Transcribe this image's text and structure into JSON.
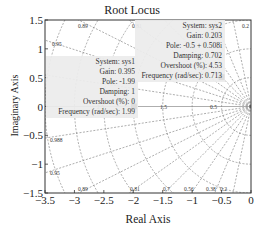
{
  "chart_data": {
    "type": "scatter",
    "title": "Root Locus",
    "xlabel": "Real Axis",
    "ylabel": "Imaginary Axis",
    "xlim": [
      -3.5,
      0
    ],
    "ylim": [
      -1.5,
      1.5
    ],
    "xticks": [
      "-3.5",
      "-3",
      "-2.5",
      "-2",
      "-1.5",
      "-1",
      "-0.5",
      "0"
    ],
    "yticks": [
      "1.5",
      "1",
      "0.5",
      "0",
      "-0.5",
      "-1",
      "-1.5"
    ],
    "grid": "s-plane damping/frequency grid (dashed)",
    "damping_labels_top": [
      "0.95",
      "0.89",
      "0.81",
      "0.2"
    ],
    "damping_labels_bottom": [
      "0.988",
      "0.95",
      "0.89",
      "0.81",
      "0.7",
      "0.56",
      "0.38",
      "0.2"
    ],
    "frequency_labels": [
      "3.5",
      "2.5",
      "1.5",
      "1",
      "0.5"
    ],
    "series": [
      {
        "name": "sys1",
        "points": [
          {
            "x": -1.99,
            "y": 0
          }
        ]
      },
      {
        "name": "sys2",
        "points": [
          {
            "x": -0.5,
            "y": 0.508
          }
        ]
      }
    ],
    "annotations": [
      {
        "system": "System: sys1",
        "gain": "Gain: 0.395",
        "pole": "Pole: -1.99",
        "damping": "Damping: 1",
        "overshoot": "Overshoot (%): 0",
        "frequency": "Frequency (rad/sec): 1.99"
      },
      {
        "system": "System: sys2",
        "gain": "Gain: 0.203",
        "pole": "Pole: -0.5 + 0.508i",
        "damping": "Damping: 0.702",
        "overshoot": "Overshoot (%): 4.53",
        "frequency": "Frequency (rad/sec): 0.713"
      }
    ]
  }
}
